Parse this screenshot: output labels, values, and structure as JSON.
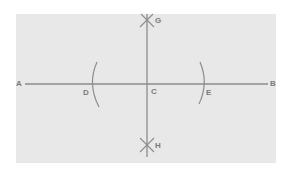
{
  "diagram": {
    "type": "geometric-construction",
    "colors": {
      "background": "#e8e8e8",
      "line": "#8c8c8c",
      "label": "#7a7a7a"
    },
    "points": {
      "A": {
        "label": "A"
      },
      "B": {
        "label": "B"
      },
      "C": {
        "label": "C"
      },
      "D": {
        "label": "D"
      },
      "E": {
        "label": "E"
      },
      "G": {
        "label": "G"
      },
      "H": {
        "label": "H"
      }
    },
    "elements": [
      {
        "kind": "segment",
        "from": "A",
        "to": "B",
        "orientation": "horizontal"
      },
      {
        "kind": "line",
        "through": [
          "G",
          "C",
          "H"
        ],
        "orientation": "vertical"
      },
      {
        "kind": "arc",
        "at": "D",
        "side": "left"
      },
      {
        "kind": "arc",
        "at": "E",
        "side": "right"
      },
      {
        "kind": "arc-intersection",
        "at": "G"
      },
      {
        "kind": "arc-intersection",
        "at": "H"
      }
    ]
  }
}
